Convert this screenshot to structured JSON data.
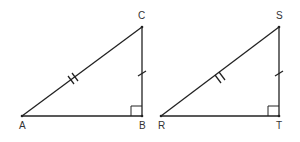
{
  "triangles": [
    {
      "name": "ABC",
      "vertices": {
        "A": "A",
        "B": "B",
        "C": "C"
      },
      "right_angle_at": "B",
      "hypotenuse_marks": 2,
      "leg_marks": 1
    },
    {
      "name": "RTS",
      "vertices": {
        "R": "R",
        "T": "T",
        "S": "S"
      },
      "right_angle_at": "T",
      "hypotenuse_marks": 2,
      "leg_marks": 1
    }
  ],
  "colors": {
    "stroke": "#222222"
  }
}
